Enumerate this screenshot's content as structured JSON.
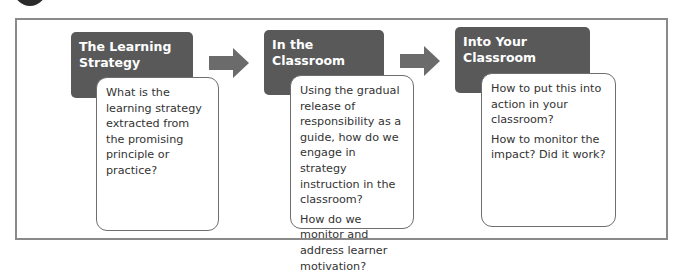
{
  "diagram": {
    "steps": [
      {
        "title": "The Learning Strategy",
        "title_lines": [
          "The Learning",
          "Strategy"
        ],
        "questions": [
          "What is the learning strategy extracted from the promising principle or practice?"
        ]
      },
      {
        "title": "In the Classroom",
        "title_lines": [
          "In the Classroom"
        ],
        "questions": [
          "Using the gradual release of responsibility as a guide, how do we engage in strategy instruction in the classroom?",
          "How do we monitor and address learner motivation?"
        ]
      },
      {
        "title": "Into Your Classroom",
        "title_lines": [
          "Into Your Classroom"
        ],
        "questions": [
          "How to put this into action in your classroom?",
          "How to monitor the impact? Did it work?"
        ]
      }
    ],
    "connectors": [
      "arrow-right",
      "arrow-right"
    ],
    "colors": {
      "header_bg": "#595959",
      "arrow": "#6b6b6b",
      "frame": "#8a8a8a",
      "card_border": "#6e6e6e",
      "text": "#333333"
    }
  }
}
